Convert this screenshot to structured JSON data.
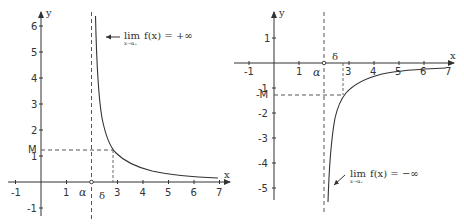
{
  "left_graph": {
    "x_axis_label": "x",
    "y_axis_label": "y",
    "x_ticks": [
      "-1",
      "1",
      "3",
      "4",
      "5",
      "6",
      "7"
    ],
    "y_ticks": [
      "6",
      "5",
      "4",
      "3",
      "2",
      "1",
      "-1"
    ],
    "alpha_label": "α",
    "delta_label": "δ",
    "m_label": "M",
    "annotation": {
      "lim": "lim",
      "sub": "x→α₊",
      "expr": "f(x) = +∞"
    }
  },
  "right_graph": {
    "x_axis_label": "x",
    "y_axis_label": "y",
    "x_ticks": [
      "-1",
      "1",
      "3",
      "4",
      "5",
      "6",
      "7"
    ],
    "y_ticks": [
      "1",
      "-1",
      "-2",
      "-3",
      "-4",
      "-5"
    ],
    "alpha_label": "α",
    "delta_label": "δ",
    "m_label": "-M",
    "annotation": {
      "lim": "lim",
      "sub": "x→α₊",
      "expr": "f(x) = −∞"
    }
  }
}
